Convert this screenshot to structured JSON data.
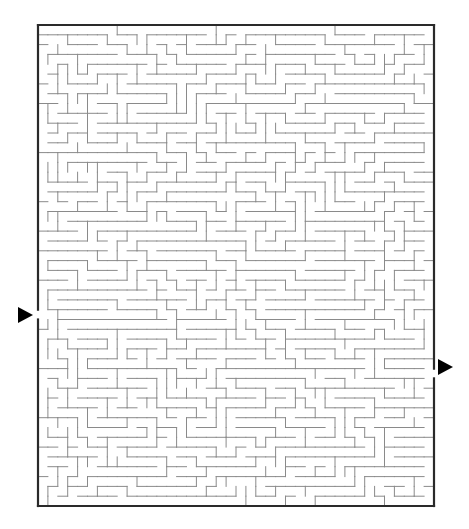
{
  "maze": {
    "cols": 40,
    "rows": 49,
    "origin": {
      "x": 38,
      "y": 25
    },
    "size": {
      "width": 396,
      "height": 481
    },
    "seed": 7331,
    "wall_color": "#8a8a8a",
    "border_color": "#2a2a2a",
    "entrance": {
      "side": "left",
      "row": 29,
      "label": "start"
    },
    "exit": {
      "side": "right",
      "row": 35,
      "label": "finish"
    }
  },
  "arrows": {
    "start": {
      "name": "start-arrow",
      "direction": "right",
      "x": 18,
      "y": 315,
      "color": "#000000"
    },
    "finish": {
      "name": "finish-arrow",
      "direction": "right",
      "x": 438,
      "y": 367,
      "color": "#000000"
    }
  }
}
